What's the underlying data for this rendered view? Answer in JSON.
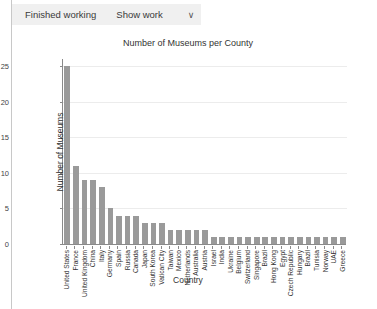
{
  "header": {
    "status_label": "Finished working",
    "show_work_label": "Show work",
    "chevron_icon": "chevron-down-icon",
    "chevron_glyph": "∨"
  },
  "chart_data": {
    "type": "bar",
    "title": "Number of Museums per County",
    "xlabel": "Country",
    "ylabel": "Number of Museums",
    "ylim": [
      0,
      26
    ],
    "yticks": [
      0,
      5,
      10,
      15,
      20,
      25
    ],
    "grid": true,
    "legend": null,
    "bar_color": "#9a9a9a",
    "categories": [
      "United States",
      "France",
      "United Kingdom",
      "China",
      "Italy",
      "Germany",
      "Spain",
      "Russia",
      "Canada",
      "Japan",
      "South Korea",
      "Vatican City",
      "Taiwan",
      "Mexico",
      "Netherlands",
      "Australia",
      "Austria",
      "Israel",
      "India",
      "Ukraine",
      "Belgium",
      "Switzerland",
      "Singapore",
      "Brazil",
      "Hong Kong",
      "Egypt",
      "Czech Republic",
      "Hungary",
      "Brazil",
      "Tunisia",
      "Norway",
      "UAE",
      "Greece"
    ],
    "values": [
      25,
      11,
      9,
      9,
      8,
      5,
      4,
      4,
      4,
      3,
      3,
      3,
      2,
      2,
      2,
      2,
      2,
      1,
      1,
      1,
      1,
      1,
      1,
      1,
      1,
      1,
      1,
      1,
      1,
      1,
      1,
      1,
      1
    ]
  }
}
